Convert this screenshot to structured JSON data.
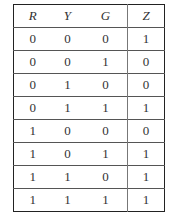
{
  "table": {
    "headers": [
      "R",
      "Y",
      "G",
      "Z"
    ],
    "rows": [
      [
        "0",
        "0",
        "0",
        "1"
      ],
      [
        "0",
        "0",
        "1",
        "0"
      ],
      [
        "0",
        "1",
        "0",
        "0"
      ],
      [
        "0",
        "1",
        "1",
        "1"
      ],
      [
        "1",
        "0",
        "0",
        "0"
      ],
      [
        "1",
        "0",
        "1",
        "1"
      ],
      [
        "1",
        "1",
        "0",
        "1"
      ],
      [
        "1",
        "1",
        "1",
        "1"
      ]
    ]
  }
}
